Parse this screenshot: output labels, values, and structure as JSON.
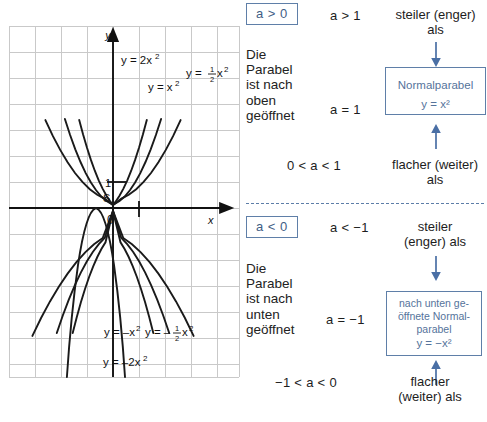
{
  "graph": {
    "axis_label_x": "x",
    "axis_label_y": "y",
    "origin_label": "0",
    "vertex_label": "S",
    "unit_label": "1",
    "curve_labels": [
      {
        "id": "y-2x2",
        "text": "y = 2x²"
      },
      {
        "id": "y-x2",
        "text": "y = x²"
      },
      {
        "id": "y-half-x2",
        "text": "y = ½x²"
      },
      {
        "id": "y-neg-x2",
        "text": "y = −x²"
      },
      {
        "id": "y-neg-half-x2",
        "text": "y = −½x²"
      },
      {
        "id": "y-neg-2x2",
        "text": "y = −2x²"
      }
    ],
    "grid": {
      "cols": 9,
      "rows": 13,
      "cell_px": 26
    },
    "curves": [
      {
        "name": "y = 2x²",
        "a": 2
      },
      {
        "name": "y = x²",
        "a": 1
      },
      {
        "name": "y = ½x²",
        "a": 0.5
      },
      {
        "name": "y = −x²",
        "a": -1
      },
      {
        "name": "y = −½x²",
        "a": -0.5
      },
      {
        "name": "y = −2x²",
        "a": -2
      }
    ]
  },
  "sections": {
    "positive": {
      "badge": "a > 0",
      "description": "Die\nParabel\nist nach\noben\ngeöffnet",
      "cond_top": "a > 1",
      "rel_top": "steiler (enger)\nals",
      "cond_mid": "a = 1",
      "cond_bottom": "0 < a < 1",
      "rel_bottom": "flacher (weiter)\nals",
      "box_title": "Normalparabel",
      "box_equation": "y = x²"
    },
    "negative": {
      "badge": "a < 0",
      "description": "Die\nParabel\nist nach\nunten\ngeöffnet",
      "cond_top": "a < −1",
      "rel_top": "steiler\n(enger) als",
      "cond_mid": "a = −1",
      "cond_bottom": "−1 < a < 0",
      "rel_bottom": "flacher\n(weiter) als",
      "box_line1": "nach unten ge-",
      "box_line2": "öffnete Normal-",
      "box_line3": "parabel",
      "box_equation": "y = −x²"
    }
  },
  "colors": {
    "accent_blue": "#5f7fa8",
    "box_text": "#55739b",
    "grid": "#c9c9c9",
    "curve": "#1a1a1a"
  }
}
